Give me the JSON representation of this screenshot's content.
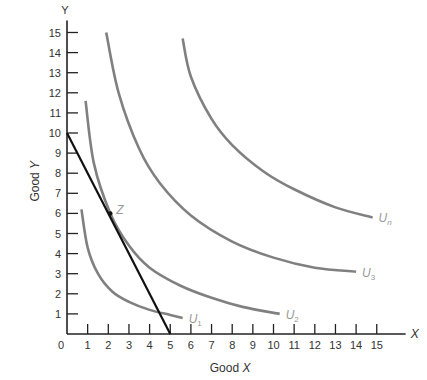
{
  "chart_data": {
    "type": "line",
    "title": "",
    "xlabel": "Good X",
    "ylabel": "Good Y",
    "x_axis_letter": "X",
    "y_axis_letter": "Y",
    "xlim": [
      0,
      16
    ],
    "ylim": [
      0,
      15.5
    ],
    "xticks": [
      0,
      1,
      2,
      3,
      4,
      5,
      6,
      7,
      8,
      9,
      10,
      11,
      12,
      13,
      14,
      15
    ],
    "yticks": [
      1,
      2,
      3,
      4,
      5,
      6,
      7,
      8,
      9,
      10,
      11,
      12,
      13,
      14,
      15
    ],
    "grid": false,
    "budget_line": {
      "name": "Budget line",
      "points": [
        [
          0,
          10
        ],
        [
          5,
          0
        ]
      ],
      "color": "#111111"
    },
    "series": [
      {
        "name": "U1",
        "label": "U",
        "sub": "1",
        "color": "#808080",
        "points": [
          [
            0.7,
            6.2
          ],
          [
            1.0,
            4.3
          ],
          [
            1.5,
            3.0
          ],
          [
            2.2,
            2.1
          ],
          [
            3.0,
            1.6
          ],
          [
            4.0,
            1.2
          ],
          [
            5.0,
            0.95
          ],
          [
            5.6,
            0.8
          ]
        ]
      },
      {
        "name": "U2",
        "label": "U",
        "sub": "2",
        "color": "#808080",
        "points": [
          [
            0.9,
            11.6
          ],
          [
            1.3,
            8.5
          ],
          [
            2.1,
            6.0
          ],
          [
            3.0,
            4.4
          ],
          [
            4.0,
            3.3
          ],
          [
            5.5,
            2.4
          ],
          [
            7.0,
            1.8
          ],
          [
            8.5,
            1.35
          ],
          [
            10.3,
            1.0
          ]
        ]
      },
      {
        "name": "U3",
        "label": "U",
        "sub": "3",
        "color": "#808080",
        "points": [
          [
            1.9,
            15.0
          ],
          [
            2.5,
            12.0
          ],
          [
            3.5,
            9.2
          ],
          [
            4.5,
            7.5
          ],
          [
            6.0,
            5.9
          ],
          [
            8.0,
            4.6
          ],
          [
            10.0,
            3.8
          ],
          [
            12.0,
            3.3
          ],
          [
            14.0,
            3.1
          ]
        ]
      },
      {
        "name": "Un",
        "label": "U",
        "sub": "n",
        "color": "#808080",
        "points": [
          [
            5.6,
            14.7
          ],
          [
            6.0,
            12.8
          ],
          [
            7.0,
            10.7
          ],
          [
            8.0,
            9.4
          ],
          [
            9.5,
            8.1
          ],
          [
            11.0,
            7.2
          ],
          [
            13.0,
            6.3
          ],
          [
            14.8,
            5.8
          ]
        ]
      }
    ],
    "annotations": [
      {
        "text": "Z",
        "x": 2.1,
        "y": 6.0
      }
    ]
  }
}
